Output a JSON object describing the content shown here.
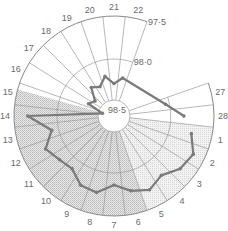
{
  "chart_data": {
    "type": "polar-line",
    "title": "",
    "center": [
      114,
      116
    ],
    "radial_axis": {
      "label": "temperature",
      "ticks": [
        {
          "label": "97·5",
          "value": 97.5,
          "radius": 100
        },
        {
          "label": "98·0",
          "value": 98.0,
          "radius": 57
        },
        {
          "label": "98·5",
          "value": 98.5,
          "radius": 16
        }
      ],
      "note": "higher values toward the center"
    },
    "angular_axis": {
      "label": "day",
      "categories": [
        "1",
        "2",
        "3",
        "4",
        "5",
        "6",
        "7",
        "8",
        "9",
        "10",
        "11",
        "12",
        "13",
        "14",
        "15",
        "16",
        "17",
        "18",
        "19",
        "20",
        "21",
        "22",
        "27",
        "28"
      ],
      "visible_labels": [
        "1",
        "2",
        "3",
        "4",
        "5",
        "6",
        "7",
        "8",
        "9",
        "10",
        "11",
        "12",
        "13",
        "14",
        "15",
        "16",
        "17",
        "18",
        "19",
        "20",
        "21",
        "22",
        "27",
        "28"
      ],
      "days_per_cycle": 28,
      "gap": "days 23-26 not drawn"
    },
    "series": [
      {
        "name": "temperature",
        "color": "#7a7a7a",
        "x": [
          1,
          2,
          3,
          4,
          5,
          6,
          7,
          8,
          9,
          10,
          11,
          12,
          13,
          14,
          15,
          16,
          17,
          18,
          19,
          20,
          21,
          22,
          27,
          28
        ],
        "values": [
          97.74,
          97.64,
          97.68,
          97.78,
          97.71,
          97.77,
          97.86,
          97.75,
          97.77,
          97.88,
          97.85,
          97.78,
          97.92,
          97.66,
          98.55,
          98.35,
          98.4,
          98.25,
          98.3,
          98.2,
          98.3,
          98.22,
          98.05,
          97.85
        ]
      }
    ],
    "shaded_region": {
      "from_day": 6,
      "to_day": 15,
      "fill": "hatched grey"
    },
    "grid": true
  }
}
